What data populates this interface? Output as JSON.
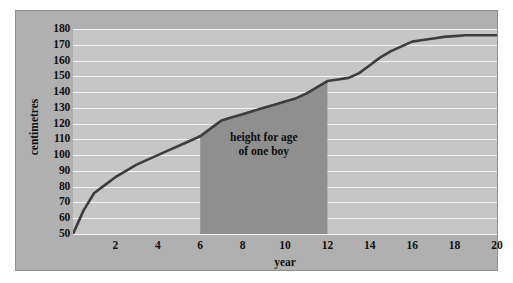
{
  "chart_data": {
    "type": "line",
    "title": "",
    "xlabel": "year",
    "ylabel": "centimetres",
    "xlim": [
      0,
      20
    ],
    "ylim": [
      50,
      180
    ],
    "grid": true,
    "legend_position": "none",
    "x_ticks": [
      2,
      4,
      6,
      8,
      10,
      12,
      14,
      16,
      18,
      20
    ],
    "y_ticks": [
      50,
      60,
      70,
      80,
      90,
      100,
      110,
      120,
      130,
      140,
      150,
      160,
      170,
      180
    ],
    "series": [
      {
        "name": "height for age of one boy",
        "x": [
          0,
          0.5,
          1,
          1.5,
          2,
          2.5,
          3,
          3.5,
          4,
          4.5,
          5,
          5.5,
          6,
          6.5,
          7,
          7.5,
          8,
          8.5,
          9,
          9.5,
          10,
          10.5,
          11,
          11.5,
          12,
          12.5,
          13,
          13.5,
          14,
          14.5,
          15,
          15.5,
          16,
          16.5,
          17,
          17.5,
          18,
          18.5,
          19,
          19.5,
          20
        ],
        "values": [
          50,
          65,
          76,
          81,
          86,
          90,
          94,
          97,
          100,
          103,
          106,
          109,
          112,
          117,
          122,
          124,
          126,
          128,
          130,
          132,
          134,
          136,
          139,
          143,
          147,
          148,
          149,
          152,
          157,
          162,
          166,
          169,
          172,
          173,
          174,
          175,
          175.5,
          176,
          176,
          176,
          176
        ]
      }
    ],
    "annotations": [
      {
        "name": "shaded-band",
        "text_line1": "height  for age",
        "text_line2": "of one boy",
        "x_start": 6,
        "x_end": 12,
        "y_start": 50,
        "fill": "#8f8f8f"
      }
    ],
    "colors": {
      "line": "#3d3d3d",
      "plot_background": "#c6c6c6",
      "panel_background": "#b0b0b0",
      "gridline": "#f2f2f2",
      "band_fill": "#8f8f8f",
      "text": "#111111",
      "page_background": "#ffffff"
    }
  }
}
